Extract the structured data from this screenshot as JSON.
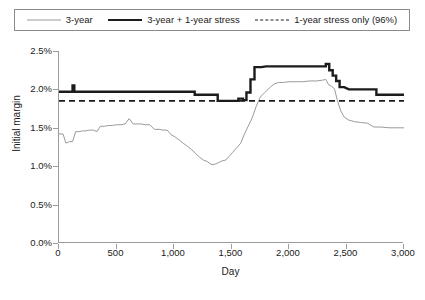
{
  "chart_data": {
    "type": "line",
    "title": "",
    "xlabel": "Day",
    "ylabel": "Initial margin",
    "xlim": [
      0,
      3000
    ],
    "ylim": [
      0,
      0.025
    ],
    "grid": false,
    "legend_position": "top",
    "xticks": [
      0,
      500,
      1000,
      1500,
      2000,
      2500,
      3000
    ],
    "xtick_labels": [
      "0",
      "500",
      "1,000",
      "1,500",
      "2,000",
      "2,500",
      "3,000"
    ],
    "yticks": [
      0.0,
      0.005,
      0.01,
      0.015,
      0.02,
      0.025
    ],
    "ytick_labels": [
      "0.0%",
      "0.5%",
      "1.0%",
      "1.5%",
      "2.0%",
      "2.5%"
    ],
    "series": [
      {
        "name": "3-year",
        "style": "thin-solid",
        "color": "#9a9a9a",
        "width": 1,
        "x": [
          0,
          35,
          60,
          90,
          118,
          145,
          175,
          205,
          235,
          265,
          300,
          330,
          360,
          395,
          430,
          465,
          500,
          540,
          575,
          610,
          645,
          680,
          715,
          750,
          790,
          830,
          870,
          905,
          940,
          975,
          1010,
          1045,
          1080,
          1115,
          1150,
          1185,
          1220,
          1255,
          1290,
          1315,
          1340,
          1365,
          1390,
          1420,
          1450,
          1480,
          1510,
          1545,
          1580,
          1610,
          1645,
          1680,
          1715,
          1750,
          1790,
          1830,
          1870,
          1910,
          1950,
          2000,
          2060,
          2120,
          2180,
          2240,
          2290,
          2320,
          2345,
          2370,
          2395,
          2420,
          2450,
          2480,
          2520,
          2570,
          2620,
          2680,
          2740,
          2800,
          2870,
          2940,
          3000
        ],
        "y": [
          0.0142,
          0.0142,
          0.013,
          0.0132,
          0.0132,
          0.0145,
          0.0145,
          0.0146,
          0.0146,
          0.0147,
          0.0147,
          0.0145,
          0.0152,
          0.0152,
          0.0153,
          0.0153,
          0.0154,
          0.0154,
          0.0155,
          0.0162,
          0.0155,
          0.0155,
          0.0155,
          0.0154,
          0.0154,
          0.0148,
          0.0148,
          0.0147,
          0.0147,
          0.0141,
          0.0138,
          0.0134,
          0.013,
          0.0126,
          0.0122,
          0.0117,
          0.0112,
          0.0108,
          0.0106,
          0.0103,
          0.0102,
          0.0103,
          0.0105,
          0.0107,
          0.0108,
          0.0113,
          0.0118,
          0.0124,
          0.013,
          0.0141,
          0.0152,
          0.0163,
          0.0178,
          0.019,
          0.0196,
          0.0202,
          0.0207,
          0.0209,
          0.0209,
          0.021,
          0.021,
          0.021,
          0.0211,
          0.0211,
          0.0212,
          0.0213,
          0.0206,
          0.0204,
          0.0201,
          0.0186,
          0.0172,
          0.0164,
          0.016,
          0.0158,
          0.0157,
          0.0156,
          0.0151,
          0.0151,
          0.015,
          0.015,
          0.015
        ]
      },
      {
        "name": "3-year + 1-year stress",
        "style": "thick-solid",
        "color": "#1c1c1c",
        "width": 2.4,
        "x": [
          0,
          100,
          118,
          118,
          133,
          133,
          200,
          300,
          400,
          500,
          600,
          700,
          800,
          900,
          1000,
          1100,
          1180,
          1180,
          1300,
          1380,
          1380,
          1450,
          1520,
          1560,
          1560,
          1600,
          1600,
          1630,
          1630,
          1665,
          1665,
          1700,
          1700,
          1760,
          1800,
          1900,
          2000,
          2100,
          2200,
          2290,
          2320,
          2320,
          2350,
          2350,
          2380,
          2380,
          2410,
          2410,
          2440,
          2440,
          2480,
          2520,
          2600,
          2700,
          2760,
          2760,
          2850,
          2950,
          3000
        ],
        "y": [
          0.0197,
          0.0197,
          0.0197,
          0.0205,
          0.0205,
          0.0197,
          0.0197,
          0.0197,
          0.0197,
          0.0197,
          0.0197,
          0.0197,
          0.0197,
          0.0197,
          0.0197,
          0.0197,
          0.0197,
          0.0193,
          0.0193,
          0.0193,
          0.0185,
          0.0185,
          0.0185,
          0.0185,
          0.0188,
          0.0188,
          0.0186,
          0.0186,
          0.0196,
          0.0196,
          0.0213,
          0.0213,
          0.0229,
          0.0229,
          0.023,
          0.023,
          0.023,
          0.023,
          0.023,
          0.023,
          0.023,
          0.0233,
          0.0233,
          0.0225,
          0.0225,
          0.0218,
          0.0218,
          0.0211,
          0.0211,
          0.0203,
          0.0203,
          0.02,
          0.02,
          0.02,
          0.02,
          0.0193,
          0.0193,
          0.0193,
          0.0193
        ]
      },
      {
        "name": "1-year stress only (96%)",
        "style": "dashed",
        "color": "#1c1c1c",
        "width": 1.8,
        "x": [
          0,
          3000
        ],
        "y": [
          0.0185,
          0.0185
        ]
      }
    ]
  },
  "legend": {
    "entries": [
      {
        "label": "3-year",
        "swatch": "thin-solid-swatch"
      },
      {
        "label": "3-year + 1-year stress",
        "swatch": "thick-solid-swatch"
      },
      {
        "label": "1-year stress only (96%)",
        "swatch": "dashed-swatch"
      }
    ]
  },
  "axes": {
    "y_title": "Initial margin",
    "x_title": "Day"
  }
}
